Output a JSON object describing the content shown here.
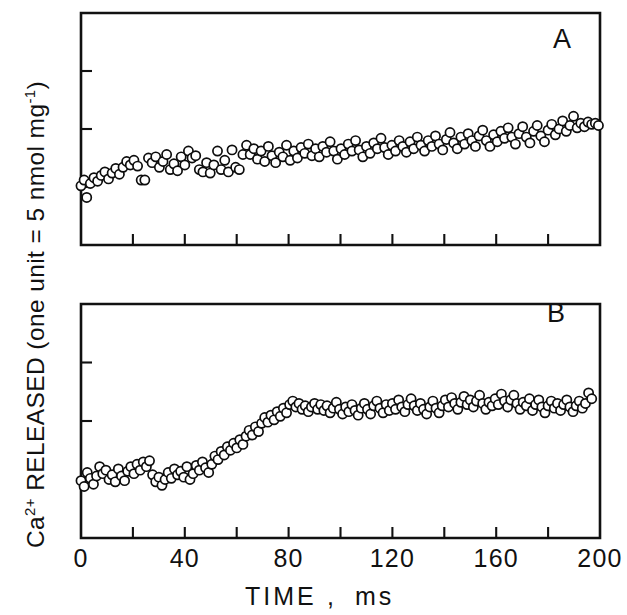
{
  "figure": {
    "background": "#ffffff",
    "ink_color": "#111111",
    "marker_style": "open-circle",
    "marker_fill": "#ffffff",
    "marker_radius_px": 4.6
  },
  "axis_label_y": {
    "parts": [
      {
        "text": "Ca",
        "sup": false
      },
      {
        "text": "2+",
        "sup": true
      },
      {
        "text": " RELEASED (one unit = 5 nmol mg",
        "sup": false
      },
      {
        "text": "-1",
        "sup": true
      },
      {
        "text": ")",
        "sup": false
      }
    ],
    "plain": "Ca2+ RELEASED (one unit = 5 nmol mg-1)"
  },
  "axis_label_x": {
    "plain": "TIME ,  ms",
    "name": "TIME",
    "separator": ",",
    "units": "ms"
  },
  "x_ticks_major": [
    {
      "value": 0,
      "label": "0"
    },
    {
      "value": 40,
      "label": "40"
    },
    {
      "value": 80,
      "label": "80"
    },
    {
      "value": 120,
      "label": "120"
    },
    {
      "value": 160,
      "label": "160"
    },
    {
      "value": 200,
      "label": "200"
    }
  ],
  "x_ticks_minor": [
    20,
    60,
    100,
    140,
    180
  ],
  "chart_data": [
    {
      "type": "scatter",
      "panel": "A",
      "panel_label": "A",
      "title": "",
      "xlabel": "TIME , ms",
      "ylabel": "Ca2+ RELEASED (one unit = 5 nmol mg-1)",
      "xlim": [
        0,
        200
      ],
      "ylim": [
        0,
        4
      ],
      "grid": false,
      "legend": "none",
      "y_tick_values": [
        1,
        2,
        3
      ],
      "y_tick_labels": [
        "",
        "",
        ""
      ],
      "marker": "open-circle",
      "points": [
        [
          0.0,
          1.02
        ],
        [
          1.2,
          1.12
        ],
        [
          2.2,
          0.82
        ],
        [
          3.6,
          1.06
        ],
        [
          5.0,
          1.16
        ],
        [
          6.4,
          1.1
        ],
        [
          7.8,
          1.2
        ],
        [
          9.2,
          1.26
        ],
        [
          10.6,
          1.14
        ],
        [
          12.0,
          1.24
        ],
        [
          13.4,
          1.32
        ],
        [
          14.8,
          1.22
        ],
        [
          16.2,
          1.34
        ],
        [
          17.6,
          1.44
        ],
        [
          19.0,
          1.38
        ],
        [
          20.4,
          1.46
        ],
        [
          21.8,
          1.36
        ],
        [
          23.2,
          1.12
        ],
        [
          24.6,
          1.12
        ],
        [
          26.0,
          1.5
        ],
        [
          27.4,
          1.42
        ],
        [
          28.8,
          1.52
        ],
        [
          30.2,
          1.34
        ],
        [
          31.6,
          1.44
        ],
        [
          33.0,
          1.56
        ],
        [
          34.4,
          1.3
        ],
        [
          35.8,
          1.4
        ],
        [
          37.2,
          1.28
        ],
        [
          38.6,
          1.52
        ],
        [
          40.0,
          1.38
        ],
        [
          41.4,
          1.62
        ],
        [
          42.8,
          1.5
        ],
        [
          44.2,
          1.54
        ],
        [
          45.6,
          1.3
        ],
        [
          47.0,
          1.26
        ],
        [
          48.4,
          1.42
        ],
        [
          49.8,
          1.24
        ],
        [
          51.2,
          1.38
        ],
        [
          52.6,
          1.62
        ],
        [
          54.0,
          1.3
        ],
        [
          55.4,
          1.46
        ],
        [
          56.8,
          1.26
        ],
        [
          58.2,
          1.64
        ],
        [
          59.6,
          1.34
        ],
        [
          61.0,
          1.3
        ],
        [
          62.4,
          1.56
        ],
        [
          63.8,
          1.72
        ],
        [
          65.2,
          1.56
        ],
        [
          66.6,
          1.66
        ],
        [
          68.0,
          1.48
        ],
        [
          69.4,
          1.62
        ],
        [
          70.8,
          1.44
        ],
        [
          72.2,
          1.7
        ],
        [
          73.6,
          1.54
        ],
        [
          75.0,
          1.42
        ],
        [
          76.4,
          1.6
        ],
        [
          77.8,
          1.52
        ],
        [
          79.2,
          1.72
        ],
        [
          80.6,
          1.46
        ],
        [
          82.0,
          1.62
        ],
        [
          83.4,
          1.5
        ],
        [
          84.8,
          1.68
        ],
        [
          86.2,
          1.58
        ],
        [
          87.6,
          1.74
        ],
        [
          89.0,
          1.54
        ],
        [
          90.4,
          1.66
        ],
        [
          91.8,
          1.52
        ],
        [
          93.2,
          1.7
        ],
        [
          94.6,
          1.6
        ],
        [
          96.0,
          1.78
        ],
        [
          97.4,
          1.62
        ],
        [
          98.8,
          1.48
        ],
        [
          100.2,
          1.66
        ],
        [
          101.6,
          1.56
        ],
        [
          103.0,
          1.74
        ],
        [
          104.4,
          1.62
        ],
        [
          105.8,
          1.8
        ],
        [
          107.2,
          1.64
        ],
        [
          108.6,
          1.52
        ],
        [
          110.0,
          1.7
        ],
        [
          111.4,
          1.58
        ],
        [
          112.8,
          1.76
        ],
        [
          114.2,
          1.66
        ],
        [
          115.6,
          1.84
        ],
        [
          117.0,
          1.68
        ],
        [
          118.4,
          1.56
        ],
        [
          119.8,
          1.72
        ],
        [
          121.2,
          1.62
        ],
        [
          122.6,
          1.8
        ],
        [
          124.0,
          1.7
        ],
        [
          125.4,
          1.6
        ],
        [
          126.8,
          1.78
        ],
        [
          128.2,
          1.66
        ],
        [
          129.6,
          1.86
        ],
        [
          131.0,
          1.72
        ],
        [
          132.4,
          1.62
        ],
        [
          133.8,
          1.8
        ],
        [
          135.2,
          1.7
        ],
        [
          136.6,
          1.88
        ],
        [
          138.0,
          1.74
        ],
        [
          139.4,
          1.64
        ],
        [
          140.8,
          1.82
        ],
        [
          142.2,
          1.94
        ],
        [
          143.6,
          1.76
        ],
        [
          145.0,
          1.66
        ],
        [
          146.4,
          1.86
        ],
        [
          147.8,
          1.74
        ],
        [
          149.2,
          1.92
        ],
        [
          150.6,
          1.8
        ],
        [
          152.0,
          1.7
        ],
        [
          153.4,
          1.88
        ],
        [
          154.8,
          1.98
        ],
        [
          156.2,
          1.8
        ],
        [
          157.6,
          1.7
        ],
        [
          159.0,
          1.9
        ],
        [
          160.4,
          1.78
        ],
        [
          161.8,
          1.96
        ],
        [
          163.2,
          1.84
        ],
        [
          164.6,
          2.02
        ],
        [
          166.0,
          1.86
        ],
        [
          167.4,
          1.74
        ],
        [
          168.8,
          1.92
        ],
        [
          170.2,
          2.04
        ],
        [
          171.6,
          1.86
        ],
        [
          173.0,
          1.76
        ],
        [
          174.4,
          1.96
        ],
        [
          175.8,
          2.06
        ],
        [
          177.2,
          1.88
        ],
        [
          178.6,
          1.78
        ],
        [
          180.0,
          1.98
        ],
        [
          181.4,
          2.08
        ],
        [
          182.8,
          1.9
        ],
        [
          184.2,
          2.0
        ],
        [
          185.6,
          2.14
        ],
        [
          187.0,
          1.96
        ],
        [
          188.4,
          2.06
        ],
        [
          189.8,
          2.22
        ],
        [
          191.2,
          2.02
        ],
        [
          192.6,
          2.1
        ],
        [
          194.0,
          2.04
        ],
        [
          195.4,
          2.12
        ],
        [
          196.8,
          2.08
        ],
        [
          198.2,
          2.1
        ],
        [
          199.4,
          2.06
        ]
      ]
    },
    {
      "type": "scatter",
      "panel": "B",
      "panel_label": "B",
      "title": "",
      "xlabel": "TIME , ms",
      "ylabel": "Ca2+ RELEASED (one unit = 5 nmol mg-1)",
      "xlim": [
        0,
        200
      ],
      "ylim": [
        0,
        4
      ],
      "grid": false,
      "legend": "none",
      "y_tick_values": [
        1,
        2,
        3
      ],
      "y_tick_labels": [
        "",
        "",
        ""
      ],
      "marker": "open-circle",
      "points": [
        [
          0.0,
          0.98
        ],
        [
          1.2,
          0.88
        ],
        [
          2.4,
          1.12
        ],
        [
          3.6,
          1.02
        ],
        [
          4.8,
          0.92
        ],
        [
          6.0,
          1.06
        ],
        [
          7.2,
          1.22
        ],
        [
          8.4,
          1.1
        ],
        [
          9.6,
          1.16
        ],
        [
          10.8,
          1.0
        ],
        [
          12.0,
          1.08
        ],
        [
          13.2,
          0.96
        ],
        [
          14.4,
          1.18
        ],
        [
          15.6,
          1.06
        ],
        [
          16.8,
          0.98
        ],
        [
          18.0,
          1.14
        ],
        [
          19.2,
          1.22
        ],
        [
          20.4,
          1.1
        ],
        [
          21.6,
          1.26
        ],
        [
          22.8,
          1.16
        ],
        [
          24.0,
          1.3
        ],
        [
          25.2,
          1.22
        ],
        [
          26.4,
          1.32
        ],
        [
          27.6,
          1.08
        ],
        [
          28.8,
          0.96
        ],
        [
          30.0,
          1.04
        ],
        [
          31.2,
          0.9
        ],
        [
          32.4,
          1.0
        ],
        [
          33.6,
          1.12
        ],
        [
          34.8,
          1.02
        ],
        [
          36.0,
          1.18
        ],
        [
          37.2,
          1.08
        ],
        [
          38.4,
          1.14
        ],
        [
          39.6,
          1.04
        ],
        [
          40.8,
          1.22
        ],
        [
          42.0,
          1.0
        ],
        [
          43.2,
          1.1
        ],
        [
          44.4,
          1.24
        ],
        [
          45.6,
          1.16
        ],
        [
          46.8,
          1.3
        ],
        [
          48.0,
          1.2
        ],
        [
          49.2,
          1.12
        ],
        [
          50.4,
          1.26
        ],
        [
          51.6,
          1.4
        ],
        [
          52.8,
          1.34
        ],
        [
          54.0,
          1.48
        ],
        [
          55.2,
          1.42
        ],
        [
          56.4,
          1.56
        ],
        [
          57.6,
          1.5
        ],
        [
          58.8,
          1.62
        ],
        [
          60.0,
          1.54
        ],
        [
          61.2,
          1.68
        ],
        [
          62.4,
          1.6
        ],
        [
          63.6,
          1.74
        ],
        [
          64.8,
          1.84
        ],
        [
          66.0,
          1.76
        ],
        [
          67.2,
          1.9
        ],
        [
          68.4,
          1.82
        ],
        [
          69.6,
          1.96
        ],
        [
          70.8,
          2.06
        ],
        [
          72.0,
          1.98
        ],
        [
          73.2,
          2.1
        ],
        [
          74.4,
          2.02
        ],
        [
          75.6,
          2.16
        ],
        [
          76.8,
          2.08
        ],
        [
          78.0,
          2.22
        ],
        [
          79.2,
          2.14
        ],
        [
          80.4,
          2.28
        ],
        [
          81.6,
          2.34
        ],
        [
          82.8,
          2.24
        ],
        [
          84.0,
          2.3
        ],
        [
          85.2,
          2.2
        ],
        [
          86.4,
          2.26
        ],
        [
          87.6,
          2.16
        ],
        [
          88.8,
          2.24
        ],
        [
          90.0,
          2.3
        ],
        [
          91.2,
          2.2
        ],
        [
          92.4,
          2.28
        ],
        [
          93.6,
          2.18
        ],
        [
          94.8,
          2.26
        ],
        [
          96.0,
          2.14
        ],
        [
          97.2,
          2.22
        ],
        [
          98.4,
          2.32
        ],
        [
          99.6,
          2.2
        ],
        [
          100.8,
          2.12
        ],
        [
          102.0,
          2.24
        ],
        [
          103.2,
          2.16
        ],
        [
          104.4,
          2.28
        ],
        [
          105.6,
          2.18
        ],
        [
          106.8,
          2.1
        ],
        [
          108.0,
          2.22
        ],
        [
          109.2,
          2.3
        ],
        [
          110.4,
          2.2
        ],
        [
          111.6,
          2.12
        ],
        [
          112.8,
          2.26
        ],
        [
          114.0,
          2.34
        ],
        [
          115.2,
          2.22
        ],
        [
          116.4,
          2.14
        ],
        [
          117.6,
          2.28
        ],
        [
          118.8,
          2.18
        ],
        [
          120.0,
          2.3
        ],
        [
          121.2,
          2.2
        ],
        [
          122.4,
          2.36
        ],
        [
          123.6,
          2.24
        ],
        [
          124.8,
          2.16
        ],
        [
          126.0,
          2.28
        ],
        [
          127.2,
          2.38
        ],
        [
          128.4,
          2.26
        ],
        [
          129.6,
          2.18
        ],
        [
          130.8,
          2.3
        ],
        [
          132.0,
          2.2
        ],
        [
          133.2,
          2.12
        ],
        [
          134.4,
          2.24
        ],
        [
          135.6,
          2.34
        ],
        [
          136.8,
          2.22
        ],
        [
          138.0,
          2.14
        ],
        [
          139.2,
          2.26
        ],
        [
          140.4,
          2.36
        ],
        [
          141.6,
          2.24
        ],
        [
          142.8,
          2.4
        ],
        [
          144.0,
          2.3
        ],
        [
          145.2,
          2.2
        ],
        [
          146.4,
          2.32
        ],
        [
          147.6,
          2.42
        ],
        [
          148.8,
          2.28
        ],
        [
          150.0,
          2.36
        ],
        [
          151.2,
          2.24
        ],
        [
          152.4,
          2.34
        ],
        [
          153.6,
          2.44
        ],
        [
          154.8,
          2.3
        ],
        [
          156.0,
          2.2
        ],
        [
          157.2,
          2.32
        ],
        [
          158.4,
          2.26
        ],
        [
          159.6,
          2.38
        ],
        [
          160.8,
          2.28
        ],
        [
          162.0,
          2.46
        ],
        [
          163.2,
          2.34
        ],
        [
          164.4,
          2.24
        ],
        [
          165.6,
          2.36
        ],
        [
          166.8,
          2.44
        ],
        [
          168.0,
          2.3
        ],
        [
          169.2,
          2.2
        ],
        [
          170.4,
          2.32
        ],
        [
          171.6,
          2.26
        ],
        [
          172.8,
          2.38
        ],
        [
          174.0,
          2.18
        ],
        [
          175.2,
          2.28
        ],
        [
          176.4,
          2.36
        ],
        [
          177.6,
          2.24
        ],
        [
          178.8,
          2.14
        ],
        [
          180.0,
          2.26
        ],
        [
          181.2,
          2.34
        ],
        [
          182.4,
          2.22
        ],
        [
          183.6,
          2.3
        ],
        [
          184.8,
          2.18
        ],
        [
          186.0,
          2.28
        ],
        [
          187.2,
          2.36
        ],
        [
          188.4,
          2.24
        ],
        [
          189.6,
          2.16
        ],
        [
          190.8,
          2.26
        ],
        [
          192.0,
          2.34
        ],
        [
          193.2,
          2.22
        ],
        [
          194.4,
          2.3
        ],
        [
          195.6,
          2.48
        ],
        [
          196.8,
          2.38
        ]
      ]
    }
  ]
}
